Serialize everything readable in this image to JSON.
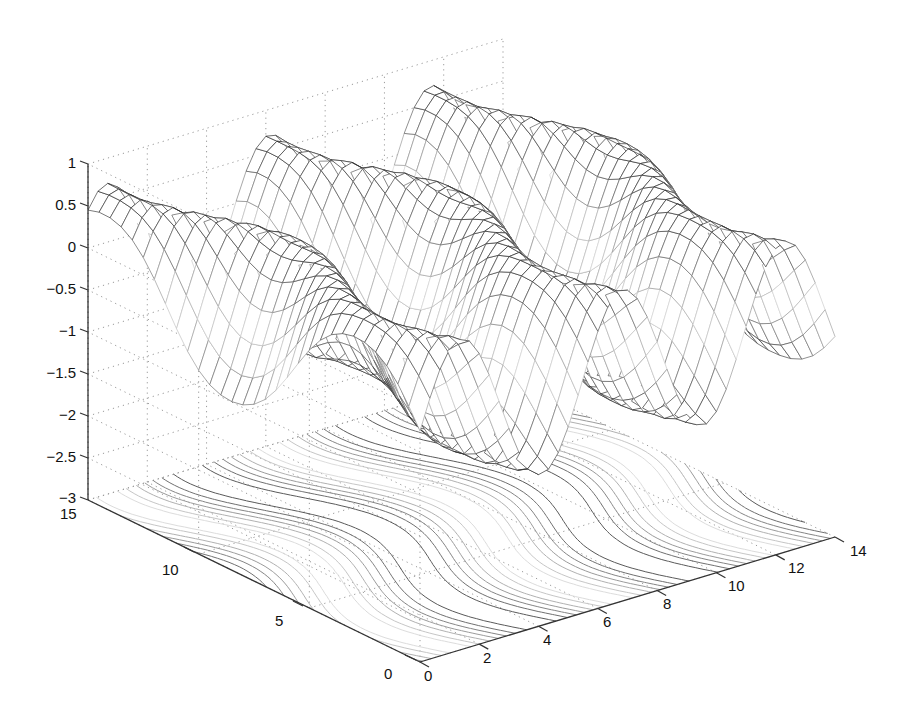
{
  "chart_data": {
    "type": "surface-mesh-with-contour",
    "title": "",
    "xlabel": "",
    "ylabel": "",
    "zlabel": "",
    "x_ticks": [
      "0",
      "2",
      "4",
      "6",
      "8",
      "10",
      "12",
      "14"
    ],
    "y_ticks": [
      "0",
      "5",
      "10",
      "15"
    ],
    "z_ticks": [
      "-3",
      "-2.5",
      "-2",
      "-1.5",
      "-1",
      "-0.5",
      "0",
      "0.5",
      "1"
    ],
    "xlim": [
      0,
      14
    ],
    "ylim": [
      0,
      15
    ],
    "zlim": [
      -3,
      1
    ],
    "grid": true,
    "grid_style": "dotted",
    "legend": null,
    "surface": {
      "description": "Sinusoidal ridged mesh surface, z ≈ sin(x + 0.6*sin(y)) style waves, amplitude ~1, ridges running along y",
      "z_range": [
        -1.2,
        0.7
      ],
      "colormap": "grayscale"
    },
    "contour": {
      "plane_z": -3,
      "description": "Contour lines of the surface projected onto the z = -3 floor plane",
      "levels": 7
    }
  },
  "axes": {
    "z_labels": [
      "1",
      "0.5",
      "0",
      "-0.5",
      "-1",
      "-1.5",
      "-2",
      "-2.5",
      "-3"
    ],
    "y_labels": [
      "15",
      "10",
      "5",
      "0"
    ],
    "x_labels": [
      "0",
      "2",
      "4",
      "6",
      "8",
      "10",
      "12",
      "14"
    ]
  }
}
